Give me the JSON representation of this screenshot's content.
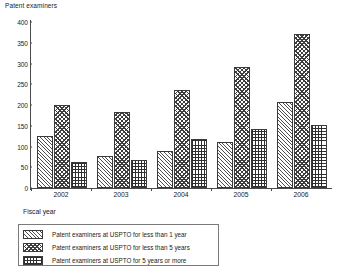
{
  "chart_data": {
    "type": "bar",
    "title": "",
    "ylabel": "Patent examiners",
    "xlabel": "Fiscal year",
    "ylim": [
      0,
      400
    ],
    "yticks": [
      0,
      50,
      100,
      150,
      200,
      250,
      300,
      350,
      400
    ],
    "grid": false,
    "legend_position": "below-axis",
    "categories": [
      "2002",
      "2003",
      "2004",
      "2005",
      "2006"
    ],
    "series": [
      {
        "name": "Patent examiners at USPTO for less than 1 year",
        "pattern": "diagonal-hatch",
        "values": [
          125,
          78,
          88,
          110,
          208
        ]
      },
      {
        "name": "Patent examiners at USPTO for less than 5 years",
        "pattern": "checker",
        "values": [
          200,
          182,
          235,
          292,
          370
        ]
      },
      {
        "name": "Patent examiners at USPTO for 5 years or more",
        "pattern": "grid",
        "values": [
          62,
          68,
          118,
          143,
          152
        ]
      }
    ]
  },
  "colors": {
    "axis": "#4a4a4a",
    "bar_outline": "#3a3a3a",
    "text": "#1a1a1a",
    "legend_border": "#7a7a7a",
    "background": "#ffffff"
  }
}
